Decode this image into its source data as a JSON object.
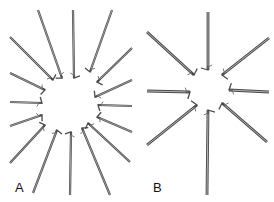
{
  "figure": {
    "panels": [
      {
        "id": "A",
        "label": "A",
        "description": "Instruments arranged radially around a central opening",
        "instrument_count": 16,
        "instruments": [
          {
            "outer": [
              38,
              10
            ],
            "inner": [
              62,
              78
            ]
          },
          {
            "outer": [
              73,
              10
            ],
            "inner": [
              74,
              78
            ]
          },
          {
            "outer": [
              112,
              10
            ],
            "inner": [
              90,
              72
            ]
          },
          {
            "outer": [
              132,
              48
            ],
            "inner": [
              97,
              82
            ]
          },
          {
            "outer": [
              132,
              80
            ],
            "inner": [
              95,
              97
            ]
          },
          {
            "outer": [
              132,
              106
            ],
            "inner": [
              98,
              105
            ]
          },
          {
            "outer": [
              132,
              132
            ],
            "inner": [
              97,
              117
            ]
          },
          {
            "outer": [
              130,
              162
            ],
            "inner": [
              88,
              123
            ]
          },
          {
            "outer": [
              110,
              195
            ],
            "inner": [
              82,
              128
            ]
          },
          {
            "outer": [
              70,
              195
            ],
            "inner": [
              71,
              132
            ]
          },
          {
            "outer": [
              33,
              193
            ],
            "inner": [
              57,
              130
            ]
          },
          {
            "outer": [
              10,
              163
            ],
            "inner": [
              45,
              125
            ]
          },
          {
            "outer": [
              10,
              126
            ],
            "inner": [
              42,
              115
            ]
          },
          {
            "outer": [
              10,
              102
            ],
            "inner": [
              42,
              103
            ]
          },
          {
            "outer": [
              10,
              73
            ],
            "inner": [
              45,
              90
            ]
          },
          {
            "outer": [
              10,
              37
            ],
            "inner": [
              53,
              80
            ]
          }
        ]
      },
      {
        "id": "B",
        "label": "B",
        "description": "Instruments arranged radially around a central opening",
        "instrument_count": 8,
        "instruments": [
          {
            "outer": [
              208,
              12
            ],
            "inner": [
              208,
              70
            ]
          },
          {
            "outer": [
              269,
              38
            ],
            "inner": [
              222,
              75
            ]
          },
          {
            "outer": [
              269,
              92
            ],
            "inner": [
              229,
              90
            ]
          },
          {
            "outer": [
              267,
              142
            ],
            "inner": [
              222,
              103
            ]
          },
          {
            "outer": [
              207,
              195
            ],
            "inner": [
              208,
              110
            ]
          },
          {
            "outer": [
              147,
              145
            ],
            "inner": [
              197,
              105
            ]
          },
          {
            "outer": [
              147,
              91
            ],
            "inner": [
              190,
              92
            ]
          },
          {
            "outer": [
              147,
              32
            ],
            "inner": [
              194,
              75
            ]
          }
        ]
      }
    ],
    "colors": {
      "background": "#ffffff",
      "rod_dark": "#4a4a4a",
      "rod_light": "#b5b5b5",
      "label": "#111111"
    }
  }
}
